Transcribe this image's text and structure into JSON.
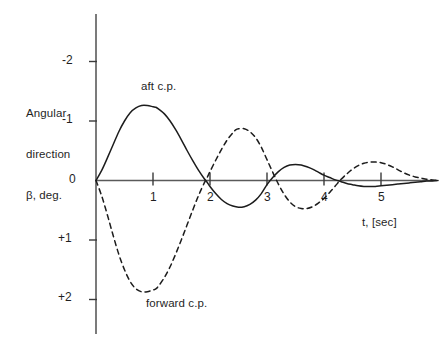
{
  "chart_data": {
    "type": "line",
    "title": "",
    "subtitle": "",
    "xlabel": "t, [sec]",
    "ylabel": "Angular direction β, deg.",
    "ylabel_lines": [
      "Angular",
      "direction",
      "β, deg."
    ],
    "xlim": [
      0,
      6.1
    ],
    "ylim": [
      -2.45,
      2.55
    ],
    "y_axis_inverted": true,
    "grid": false,
    "legend": "inline-annotations",
    "xticks": [
      1,
      2,
      3,
      4,
      5
    ],
    "xtick_labels": [
      "1",
      "2",
      "3",
      "4",
      "5"
    ],
    "yticks": [
      -2,
      -1,
      0,
      1,
      2
    ],
    "ytick_labels": [
      "-2",
      "-1",
      "0",
      "+1",
      "+2"
    ],
    "annotations": [
      {
        "text": "aft c.p.",
        "x": 1.05,
        "y": -1.62,
        "series": "aft c.p."
      },
      {
        "text": "forward c.p.",
        "x": 1.1,
        "y": 2.42,
        "series": "forward c.p."
      }
    ],
    "series": [
      {
        "name": "aft c.p.",
        "style": "solid",
        "color": "#1c1c1c",
        "x": [
          0.0,
          0.1,
          0.2,
          0.3,
          0.4,
          0.5,
          0.6,
          0.7,
          0.8,
          0.9,
          1.0,
          1.05,
          1.1,
          1.2,
          1.3,
          1.4,
          1.5,
          1.6,
          1.7,
          1.8,
          1.9,
          1.95,
          2.0,
          2.1,
          2.2,
          2.3,
          2.4,
          2.5,
          2.6,
          2.7,
          2.8,
          2.9,
          3.0,
          3.1,
          3.2,
          3.3,
          3.4,
          3.5,
          3.6,
          3.7,
          3.8,
          3.9,
          4.0,
          4.1,
          4.2,
          4.3,
          4.4,
          4.5,
          4.6,
          4.7,
          4.8,
          4.9,
          5.0,
          5.1,
          5.2,
          5.3,
          5.4,
          5.5,
          5.6,
          5.7,
          5.8,
          5.9,
          6.0
        ],
        "y": [
          0.0,
          -0.17,
          -0.38,
          -0.6,
          -0.82,
          -1.0,
          -1.14,
          -1.22,
          -1.26,
          -1.26,
          -1.24,
          -1.23,
          -1.2,
          -1.12,
          -1.0,
          -0.85,
          -0.68,
          -0.5,
          -0.33,
          -0.17,
          -0.03,
          0.03,
          0.1,
          0.22,
          0.32,
          0.39,
          0.43,
          0.45,
          0.44,
          0.4,
          0.33,
          0.22,
          0.07,
          -0.05,
          -0.15,
          -0.22,
          -0.26,
          -0.27,
          -0.26,
          -0.23,
          -0.19,
          -0.14,
          -0.09,
          -0.05,
          -0.01,
          0.02,
          0.05,
          0.07,
          0.09,
          0.1,
          0.1,
          0.1,
          0.09,
          0.08,
          0.07,
          0.06,
          0.05,
          0.04,
          0.03,
          0.02,
          0.01,
          0.01,
          0.0
        ],
        "peaks": [
          {
            "t": 1.05,
            "beta": -1.25,
            "kind": "max-negative"
          },
          {
            "t": 2.55,
            "beta": 0.45,
            "kind": "max-positive"
          },
          {
            "t": 3.55,
            "beta": -0.27,
            "kind": "max-negative"
          },
          {
            "t": 4.85,
            "beta": 0.1,
            "kind": "max-positive"
          }
        ],
        "zero_crossings": [
          0.0,
          1.95,
          2.97,
          4.22
        ]
      },
      {
        "name": "forward c.p.",
        "style": "dashed",
        "color": "#1c1c1c",
        "x": [
          0.0,
          0.1,
          0.2,
          0.3,
          0.4,
          0.5,
          0.6,
          0.7,
          0.8,
          0.9,
          1.0,
          1.05,
          1.1,
          1.2,
          1.3,
          1.4,
          1.5,
          1.6,
          1.7,
          1.8,
          1.9,
          1.95,
          2.0,
          2.1,
          2.2,
          2.3,
          2.4,
          2.45,
          2.5,
          2.6,
          2.7,
          2.8,
          2.9,
          3.0,
          3.1,
          3.2,
          3.3,
          3.4,
          3.5,
          3.6,
          3.7,
          3.8,
          3.9,
          4.0,
          4.1,
          4.2,
          4.3,
          4.4,
          4.5,
          4.6,
          4.7,
          4.8,
          4.9,
          5.0,
          5.1,
          5.2,
          5.3,
          5.4,
          5.5,
          5.6,
          5.7,
          5.8,
          5.9,
          6.0
        ],
        "y": [
          0.0,
          0.26,
          0.58,
          0.92,
          1.24,
          1.5,
          1.7,
          1.82,
          1.87,
          1.87,
          1.84,
          1.82,
          1.77,
          1.63,
          1.45,
          1.23,
          0.99,
          0.74,
          0.49,
          0.25,
          0.04,
          -0.05,
          -0.15,
          -0.34,
          -0.52,
          -0.68,
          -0.8,
          -0.85,
          -0.87,
          -0.87,
          -0.82,
          -0.72,
          -0.56,
          -0.35,
          -0.14,
          0.06,
          0.23,
          0.36,
          0.44,
          0.47,
          0.47,
          0.44,
          0.38,
          0.3,
          0.2,
          0.09,
          -0.02,
          -0.11,
          -0.19,
          -0.25,
          -0.29,
          -0.31,
          -0.31,
          -0.3,
          -0.27,
          -0.23,
          -0.18,
          -0.13,
          -0.09,
          -0.06,
          -0.04,
          -0.02,
          -0.01,
          0.0
        ],
        "peaks": [
          {
            "t": 0.88,
            "beta": 1.87,
            "kind": "max-positive"
          },
          {
            "t": 2.52,
            "beta": -0.87,
            "kind": "max-negative"
          },
          {
            "t": 3.68,
            "beta": 0.47,
            "kind": "max-positive"
          },
          {
            "t": 4.92,
            "beta": -0.31,
            "kind": "max-negative"
          }
        ],
        "zero_crossings": [
          0.0,
          1.93,
          3.17,
          4.28
        ]
      }
    ]
  },
  "axes": {
    "y_title_lines": [
      "Angular",
      "direction",
      "β, deg."
    ],
    "x_title": "t, [sec]",
    "ytick_labels": [
      "-2",
      "-1",
      "0",
      "+1",
      "+2"
    ],
    "xtick_labels": [
      "1",
      "2",
      "3",
      "4",
      "5"
    ]
  },
  "annotations": {
    "aft": "aft c.p.",
    "forward": "forward c.p."
  }
}
